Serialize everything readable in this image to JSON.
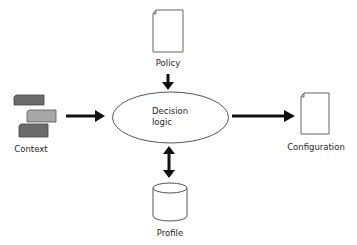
{
  "diagram": {
    "title": "",
    "nodes": {
      "policy": {
        "label": "Policy",
        "shape": "document-icon"
      },
      "context": {
        "label": "Context",
        "shape": "stacked-cards-icon"
      },
      "decision": {
        "line1": "Decision",
        "line2": "logic",
        "shape": "ellipse"
      },
      "configuration": {
        "label": "Configuration",
        "shape": "document-icon"
      },
      "profile": {
        "label": "Profile",
        "shape": "database-cylinder-icon"
      }
    },
    "edges": [
      {
        "from": "policy",
        "to": "decision",
        "direction": "one-way"
      },
      {
        "from": "context",
        "to": "decision",
        "direction": "one-way"
      },
      {
        "from": "decision",
        "to": "configuration",
        "direction": "one-way"
      },
      {
        "from": "decision",
        "to": "profile",
        "direction": "two-way"
      }
    ],
    "colors": {
      "stroke": "#555555",
      "arrow": "#111111",
      "card_dark": "#6b6b6b",
      "card_light": "#a8a8a8",
      "background": "#ffffff"
    }
  }
}
